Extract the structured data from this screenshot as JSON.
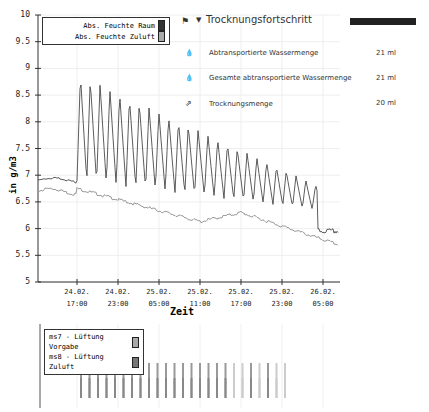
{
  "chart_data": [
    {
      "type": "line",
      "title": "",
      "xlabel": "Zeit",
      "ylabel": "in g/m3",
      "ylim": [
        5,
        10
      ],
      "yticks": [
        "10",
        "9.5",
        "9",
        "8.5",
        "8",
        "7.5",
        "7",
        "6.5",
        "6",
        "5.5",
        "5"
      ],
      "xticks": [
        {
          "date": "24.02.",
          "time": "17:00"
        },
        {
          "date": "24.02.",
          "time": "23:00"
        },
        {
          "date": "25.02.",
          "time": "05:00"
        },
        {
          "date": "25.02.",
          "time": "11:00"
        },
        {
          "date": "25.02.",
          "time": "17:00"
        },
        {
          "date": "25.02.",
          "time": "23:00"
        },
        {
          "date": "26.02.",
          "time": "05:00"
        }
      ],
      "grid": true,
      "legend_position": "top-left",
      "series": [
        {
          "name": "Abs. Feuchte Raum",
          "color": "#333333",
          "description": "~6.9 flat until 24.02 17:00, then sawtooth oscillations peaking ~8.9 decaying to ~6.8, troughs ~6.9 to ~6.4, ending ~5.95"
        },
        {
          "name": "Abs. Feuchte Zuluft",
          "color": "#999999",
          "description": "~6.75 declining to ~6.1 around 25.02 11:00, rising to ~6.3 at 25.02 17:00, declining to ~5.7"
        }
      ]
    },
    {
      "type": "bar",
      "title": "",
      "legend_position": "top-left",
      "series": [
        {
          "name": "ms7 - Lüftung Vorgabe",
          "color": "#aaaaaa"
        },
        {
          "name": "ms8 - Lüftung Zuluft",
          "color": "#777777"
        }
      ],
      "description": "periodic vertical on-pulses from ~24.02 17:00 to ~26.02 00:00"
    }
  ],
  "chart": {
    "ylabel": "in g/m3",
    "xlabel": "Zeit",
    "yticks": [
      "10",
      "9.5",
      "9",
      "8.5",
      "8",
      "7.5",
      "7",
      "6.5",
      "6",
      "5.5",
      "5"
    ],
    "xticks": [
      {
        "date": "24.02.",
        "time": "17:00"
      },
      {
        "date": "24.02.",
        "time": "23:00"
      },
      {
        "date": "25.02.",
        "time": "05:00"
      },
      {
        "date": "25.02.",
        "time": "11:00"
      },
      {
        "date": "25.02.",
        "time": "17:00"
      },
      {
        "date": "25.02.",
        "time": "23:00"
      },
      {
        "date": "26.02.",
        "time": "05:00"
      }
    ],
    "legend": [
      "Abs. Feuchte Raum",
      "Abs. Feuchte Zuluft"
    ]
  },
  "lower": {
    "legend": [
      "ms7 -  Lüftung Vorgabe",
      "ms8 -  Lüftung Zuluft"
    ]
  },
  "panel": {
    "title": "Trocknungsfortschritt",
    "items": [
      {
        "label": "Abtransportierte Wassermenge",
        "value": "21 ml",
        "icon": "droplet-icon"
      },
      {
        "label": "Gesamte abtransportierte Wassermenge",
        "value": "21 ml",
        "icon": "droplet-icon"
      },
      {
        "label": "Trocknungsmenge",
        "value": "20 ml",
        "icon": "export-icon"
      }
    ],
    "progress_color": "#222222"
  }
}
